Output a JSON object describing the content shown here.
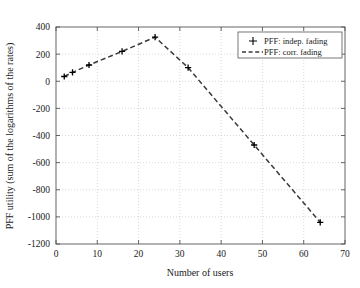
{
  "chart_data": {
    "type": "line",
    "title": "",
    "xlabel": "Number of users",
    "ylabel": "PFF utility (sum of the logarithms of the rates)",
    "xlim": [
      0,
      70
    ],
    "ylim": [
      -1200,
      400
    ],
    "xticks": [
      "0",
      "10",
      "20",
      "30",
      "40",
      "50",
      "60",
      "70"
    ],
    "xtick_values": [
      0,
      10,
      20,
      30,
      40,
      50,
      60,
      70
    ],
    "yticks": [
      "400",
      "200",
      "0",
      "-200",
      "-400",
      "-600",
      "-800",
      "-1000",
      "-1200"
    ],
    "ytick_values": [
      400,
      200,
      0,
      -200,
      -400,
      -600,
      -800,
      -1000,
      -1200
    ],
    "grid": true,
    "grid_style": "dotted",
    "legend_position": "top-right",
    "series": [
      {
        "name": "PFF: indep. fading",
        "style": "marker",
        "marker": "plus",
        "color": "#000000",
        "x": [
          2,
          4,
          8,
          16,
          24,
          32,
          48,
          64
        ],
        "values": [
          35,
          65,
          120,
          220,
          325,
          100,
          -470,
          -1040
        ]
      },
      {
        "name": "PFF: corr. fading",
        "style": "dashed-line",
        "color": "#3a3a3a",
        "x": [
          2,
          4,
          8,
          16,
          24,
          32,
          48,
          64
        ],
        "values": [
          35,
          65,
          120,
          220,
          325,
          100,
          -470,
          -1040
        ]
      }
    ]
  },
  "legend": {
    "entries": [
      {
        "label": "PFF: indep. fading",
        "marker": "plus-marker"
      },
      {
        "label": "PFF: corr. fading",
        "marker": "dashed-line-marker"
      }
    ]
  },
  "axes": {
    "x_title": "Number of users",
    "y_title": "PFF utility (sum of the logarithms of the rates)"
  }
}
